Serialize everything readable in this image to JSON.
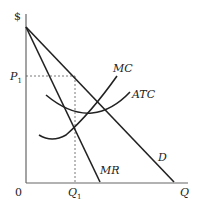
{
  "diagram": {
    "type": "monopoly-profit-maximization",
    "axes": {
      "y_label": "$",
      "x_label": "Q",
      "origin_label": "0"
    },
    "price_label": {
      "main": "P",
      "sub": "1"
    },
    "quantity_label": {
      "main": "Q",
      "sub": "1"
    },
    "curves": [
      {
        "name": "MC",
        "label": "MC"
      },
      {
        "name": "ATC",
        "label": "ATC"
      },
      {
        "name": "MR",
        "label": "MR"
      },
      {
        "name": "D",
        "label": "D"
      }
    ],
    "colors": {
      "line": "#222222",
      "axis": "#555555",
      "dashed": "#555555"
    }
  }
}
